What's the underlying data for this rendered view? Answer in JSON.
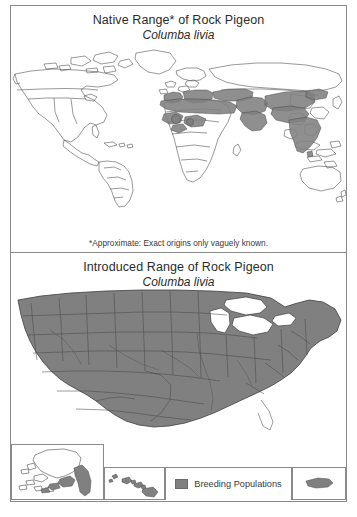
{
  "figure": {
    "panels": [
      {
        "id": "native",
        "title": "Native Range* of Rock Pigeon",
        "scientific_name": "Columba livia",
        "footnote": "*Approximate: Exact origins only vaguely known.",
        "map_type": "world",
        "shaded_regions": [
          "North Africa",
          "Sahel / West Africa",
          "Mediterranean Europe",
          "Middle East",
          "Arabian Peninsula",
          "Caucasus",
          "Central Asia",
          "Iran",
          "Indian Subcontinent"
        ]
      },
      {
        "id": "introduced",
        "title": "Introduced Range of Rock Pigeon",
        "scientific_name": "Columba livia",
        "map_type": "united-states",
        "shaded_regions": [
          "Contiguous United States",
          "Southern Alaska",
          "Hawaiian Islands",
          "Puerto Rico"
        ]
      }
    ],
    "legend": {
      "label": "Breeding Populations",
      "swatch_color": "#808080"
    },
    "insets": [
      {
        "name": "alaska",
        "label": "Alaska"
      },
      {
        "name": "hawaii",
        "label": "Hawaii"
      },
      {
        "name": "puerto-rico",
        "label": "Puerto Rico"
      }
    ],
    "colors": {
      "range_fill": "#808080",
      "outline": "#444444",
      "frame": "#8a8a8a",
      "background": "#ffffff",
      "text": "#2b2b2b"
    }
  }
}
